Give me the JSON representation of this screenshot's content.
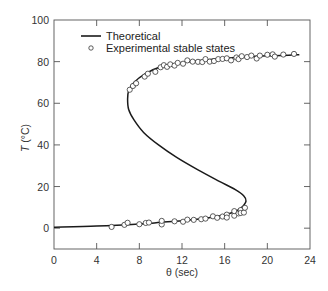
{
  "chart_data": {
    "type": "line",
    "title": "",
    "xlabel": "θ (sec)",
    "ylabel": "T (°C)",
    "xlim": [
      0,
      24
    ],
    "ylim": [
      -10,
      100
    ],
    "x_ticks": [
      0,
      4,
      8,
      12,
      16,
      20,
      24
    ],
    "y_ticks": [
      0,
      20,
      40,
      60,
      80,
      100
    ],
    "grid": false,
    "legend_position": "upper-left",
    "legend": [
      {
        "label": "Theoretical",
        "marker": "line"
      },
      {
        "label": "Experimental stable states",
        "marker": "open-circle"
      }
    ],
    "series": [
      {
        "name": "Theoretical",
        "style": "solid-line",
        "color": "#1a1a1a",
        "points": [
          [
            0,
            0.5
          ],
          [
            4,
            1.0
          ],
          [
            8,
            2.0
          ],
          [
            10,
            2.8
          ],
          [
            12,
            3.6
          ],
          [
            14,
            4.6
          ],
          [
            15,
            5.4
          ],
          [
            16,
            6.4
          ],
          [
            17,
            8.0
          ],
          [
            17.6,
            10.0
          ],
          [
            18.0,
            13.0
          ],
          [
            17.8,
            15.5
          ],
          [
            17.0,
            18.5
          ],
          [
            15.5,
            22.5
          ],
          [
            13.5,
            28
          ],
          [
            11.5,
            34
          ],
          [
            9.8,
            40
          ],
          [
            8.4,
            46
          ],
          [
            7.5,
            52
          ],
          [
            7.0,
            57
          ],
          [
            6.9,
            62
          ],
          [
            7.0,
            66
          ],
          [
            7.5,
            70
          ],
          [
            8.5,
            74
          ],
          [
            10,
            77.5
          ],
          [
            12,
            79.5
          ],
          [
            14,
            80.7
          ],
          [
            16,
            81.6
          ],
          [
            18,
            82.3
          ],
          [
            20,
            82.8
          ],
          [
            22,
            83.1
          ],
          [
            23,
            83.3
          ]
        ]
      },
      {
        "name": "Experimental stable states",
        "style": "open-circle",
        "color": "#1a1a1a",
        "points": [
          [
            5.4,
            0.6
          ],
          [
            6.6,
            1.6
          ],
          [
            6.9,
            2.6
          ],
          [
            8.0,
            1.9
          ],
          [
            8.6,
            2.5
          ],
          [
            8.9,
            2.7
          ],
          [
            10.1,
            1.8
          ],
          [
            10.1,
            3.5
          ],
          [
            11.3,
            3.3
          ],
          [
            12.1,
            3.1
          ],
          [
            12.5,
            4.1
          ],
          [
            13.1,
            4.0
          ],
          [
            13.8,
            4.3
          ],
          [
            14.2,
            4.6
          ],
          [
            14.9,
            5.7
          ],
          [
            15.3,
            5.0
          ],
          [
            15.8,
            5.6
          ],
          [
            16.2,
            6.5
          ],
          [
            16.2,
            5.1
          ],
          [
            16.9,
            6.0
          ],
          [
            16.9,
            8.2
          ],
          [
            17.3,
            7.1
          ],
          [
            17.5,
            8.7
          ],
          [
            17.5,
            7.3
          ],
          [
            17.8,
            7.5
          ],
          [
            17.9,
            9.8
          ],
          [
            7.1,
            66.5
          ],
          [
            7.4,
            68.3
          ],
          [
            7.7,
            69.6
          ],
          [
            8.5,
            72.8
          ],
          [
            8.8,
            74.2
          ],
          [
            9.5,
            75.1
          ],
          [
            10.0,
            77.3
          ],
          [
            10.3,
            78.3
          ],
          [
            10.6,
            77.5
          ],
          [
            10.9,
            78.7
          ],
          [
            11.3,
            78.1
          ],
          [
            11.6,
            79.4
          ],
          [
            12.1,
            79.0
          ],
          [
            12.5,
            80.6
          ],
          [
            13.0,
            80.0
          ],
          [
            13.5,
            79.9
          ],
          [
            13.9,
            79.8
          ],
          [
            14.2,
            81.2
          ],
          [
            14.6,
            80.0
          ],
          [
            15.0,
            80.3
          ],
          [
            15.4,
            81.2
          ],
          [
            15.8,
            81.3
          ],
          [
            16.2,
            81.6
          ],
          [
            16.6,
            80.6
          ],
          [
            17.1,
            82.0
          ],
          [
            17.3,
            81.2
          ],
          [
            17.6,
            82.6
          ],
          [
            18.1,
            82.2
          ],
          [
            18.5,
            82.9
          ],
          [
            19.0,
            81.5
          ],
          [
            19.3,
            82.9
          ],
          [
            20.0,
            83.3
          ],
          [
            20.5,
            83.5
          ],
          [
            20.7,
            82.4
          ],
          [
            21.5,
            83.4
          ],
          [
            22.5,
            83.7
          ]
        ]
      }
    ]
  },
  "legend": {
    "line_label": "Theoretical",
    "marker_label": "Experimental stable states"
  },
  "axes": {
    "xlabel": "θ (sec)",
    "ylabel_main": "T",
    "ylabel_unit": " (°C)",
    "x_tick_labels": [
      "0",
      "4",
      "8",
      "12",
      "16",
      "20",
      "24"
    ],
    "y_tick_labels": [
      "0",
      "20",
      "40",
      "60",
      "80",
      "100"
    ]
  }
}
